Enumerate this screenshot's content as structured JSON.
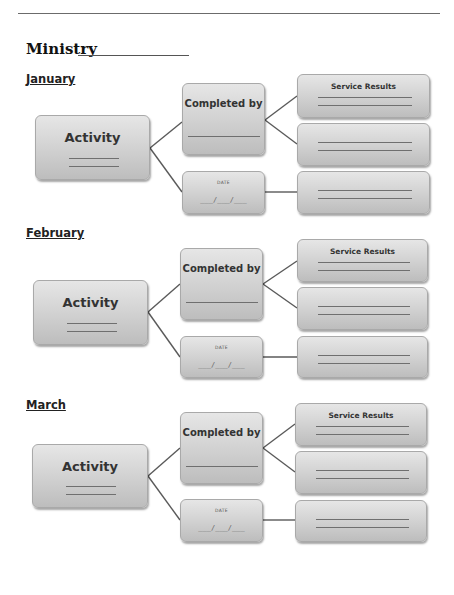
{
  "header": {
    "title": "Ministry",
    "title_blank": ""
  },
  "sections": [
    {
      "month": "January",
      "activity": {
        "label": "Activity"
      },
      "completed_by": {
        "label": "Completed by"
      },
      "date": {
        "label": "DATE",
        "blank": "___/___/___"
      },
      "results": [
        {
          "label": "Service Results"
        },
        {
          "label": ""
        },
        {
          "label": ""
        }
      ]
    },
    {
      "month": "February",
      "activity": {
        "label": "Activity"
      },
      "completed_by": {
        "label": "Completed by"
      },
      "date": {
        "label": "DATE",
        "blank": "___/___/___"
      },
      "results": [
        {
          "label": "Service Results"
        },
        {
          "label": ""
        },
        {
          "label": ""
        }
      ]
    },
    {
      "month": "March",
      "activity": {
        "label": "Activity"
      },
      "completed_by": {
        "label": "Completed by"
      },
      "date": {
        "label": "DATE",
        "blank": "___/___/___"
      },
      "results": [
        {
          "label": "Service Results"
        },
        {
          "label": ""
        },
        {
          "label": ""
        }
      ]
    }
  ],
  "colors": {
    "box_fill_top": "#e6e6e6",
    "box_fill_bottom": "#bdbdbd",
    "box_border": "#a9a9a9",
    "connector": "#5a5a5a",
    "text": "#333333"
  }
}
